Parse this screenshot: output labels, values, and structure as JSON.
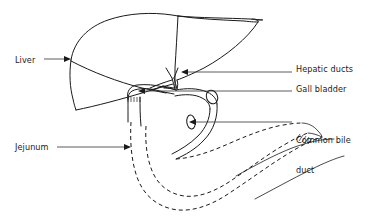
{
  "figure": {
    "type": "anatomical-line-diagram",
    "background_color": "#ffffff",
    "line_color": "#1a1a1a",
    "leader_color": "#333333"
  },
  "labels": {
    "liver": "Liver",
    "jejunum": "Jejunum",
    "hepatic_ducts": "Hepatic ducts",
    "gall_bladder": "Gall bladder",
    "common_bile_duct_line1": "Common bile",
    "common_bile_duct_line2": "duct"
  },
  "callouts": [
    {
      "name": "liver",
      "text": "Liver",
      "side": "left",
      "label_x": 15,
      "label_y": 55,
      "leader_from_x": 44,
      "leader_to_x": 71,
      "leader_y": 59,
      "arrow_direction": "right"
    },
    {
      "name": "jejunum",
      "text": "Jejunum",
      "side": "left",
      "label_x": 15,
      "label_y": 142,
      "leader_from_x": 57,
      "leader_to_x": 131,
      "leader_y": 147,
      "arrow_direction": "right"
    },
    {
      "name": "hepatic-ducts",
      "text": "Hepatic ducts",
      "side": "right",
      "label_x": 296,
      "label_y": 64,
      "leader_from_x": 292,
      "leader_to_x": 181,
      "leader_y": 72,
      "arrow_direction": "left"
    },
    {
      "name": "gall-bladder",
      "text": "Gall bladder",
      "side": "right",
      "label_x": 296,
      "label_y": 84,
      "leader_from_x": 292,
      "leader_to_x": 138,
      "leader_y": 91,
      "arrow_direction": "left"
    },
    {
      "name": "common-bile-duct",
      "text": "Common bile duct",
      "side": "right",
      "label_x": 296,
      "label_y": 115,
      "leader_from_x": 292,
      "leader_to_x": 189,
      "leader_y": 122,
      "arrow_direction": "left"
    }
  ],
  "structures": [
    {
      "name": "liver",
      "style": "solid-outline"
    },
    {
      "name": "liver-lobe-division",
      "style": "solid-line"
    },
    {
      "name": "hepatic-ducts",
      "style": "solid-branching"
    },
    {
      "name": "gall-bladder",
      "style": "solid-sac"
    },
    {
      "name": "cystic-duct",
      "style": "solid-tube"
    },
    {
      "name": "common-bile-duct",
      "style": "solid-tube"
    },
    {
      "name": "duodenum-jejunum",
      "style": "dashed-loop"
    },
    {
      "name": "hatching-marks",
      "style": "short-ticks"
    }
  ]
}
